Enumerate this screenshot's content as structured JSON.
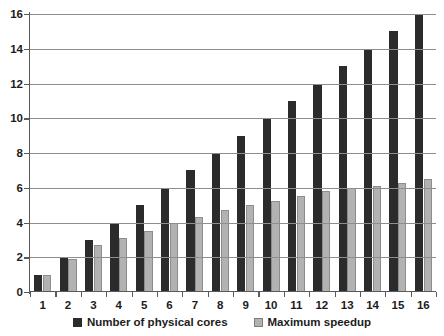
{
  "chart_data": {
    "type": "bar",
    "title": "",
    "xlabel": "",
    "ylabel": "",
    "ylim": [
      0,
      16
    ],
    "ytick_step": 2,
    "yticks": [
      0,
      2,
      4,
      6,
      8,
      10,
      12,
      14,
      16
    ],
    "grid": true,
    "legend_position": "bottom",
    "categories": [
      "1",
      "2",
      "3",
      "4",
      "5",
      "6",
      "7",
      "8",
      "9",
      "10",
      "11",
      "12",
      "13",
      "14",
      "15",
      "16"
    ],
    "series": [
      {
        "name": "Number of physical cores",
        "color": "#2b2b2b",
        "values": [
          1,
          2,
          3,
          4,
          5,
          6,
          7,
          8,
          9,
          10,
          11,
          12,
          13,
          14,
          15,
          16
        ]
      },
      {
        "name": "Maximum speedup",
        "color": "#b2b2b2",
        "values": [
          1,
          1.9,
          2.7,
          3.1,
          3.5,
          4,
          4.3,
          4.7,
          5,
          5.25,
          5.5,
          5.8,
          6,
          6.1,
          6.3,
          6.5
        ]
      }
    ]
  },
  "legend": {
    "items": [
      {
        "label": "Number of physical cores",
        "swatch": "dark"
      },
      {
        "label": "Maximum speedup",
        "swatch": "light"
      }
    ]
  }
}
